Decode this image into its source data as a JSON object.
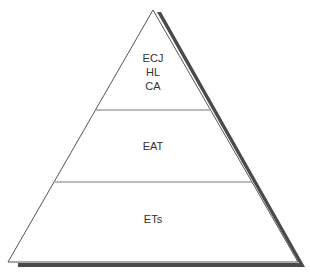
{
  "diagram": {
    "type": "pyramid",
    "colors": {
      "fill": "#ffffff",
      "stroke": "#555555",
      "divider": "#777777",
      "shadow": "#4a4a4a",
      "text": "#333333"
    },
    "levels": [
      {
        "position": "top",
        "lines": [
          "ECJ",
          "HL",
          "CA"
        ]
      },
      {
        "position": "middle",
        "lines": [
          "EAT"
        ]
      },
      {
        "position": "bottom",
        "lines": [
          "ETs"
        ]
      }
    ]
  }
}
